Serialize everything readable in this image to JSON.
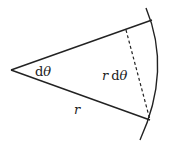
{
  "diagram": {
    "type": "arc-sector",
    "colors": {
      "stroke": "#222222",
      "background": "#ffffff"
    },
    "labels": {
      "angle": {
        "d": "d",
        "theta": "θ"
      },
      "arc_length": {
        "r": "r",
        "d": "d",
        "theta": "θ"
      },
      "radius": "r"
    }
  }
}
